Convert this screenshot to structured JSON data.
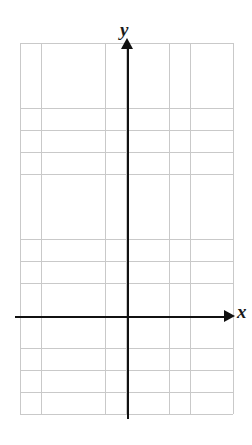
{
  "figure": {
    "kind": "blank-cartesian-coordinate-plane",
    "background_color": "#ffffff"
  },
  "grid": {
    "line_color": "#c9c9c9",
    "cell_size_px": 21.3,
    "columns": 10,
    "rows": 17,
    "columns_left_of_y_axis": 5,
    "columns_right_of_y_axis": 5,
    "rows_above_x_axis": 12,
    "rows_below_x_axis": 5
  },
  "axes": {
    "color": "#111111",
    "x": {
      "label": "x",
      "label_style": "italic-serif",
      "arrow_direction": "right",
      "has_tick_numbers": false
    },
    "y": {
      "label": "y",
      "label_style": "italic-serif",
      "arrow_direction": "up",
      "has_tick_numbers": false
    }
  },
  "chart_data": {
    "type": "scatter",
    "title": "",
    "xlabel": "x",
    "ylabel": "y",
    "series": [
      {
        "name": "",
        "x": [],
        "y": []
      }
    ],
    "xlim": [
      -5,
      5
    ],
    "ylim": [
      -5,
      12
    ],
    "xticks": [],
    "yticks": [],
    "grid": true,
    "legend": false,
    "annotations": []
  }
}
